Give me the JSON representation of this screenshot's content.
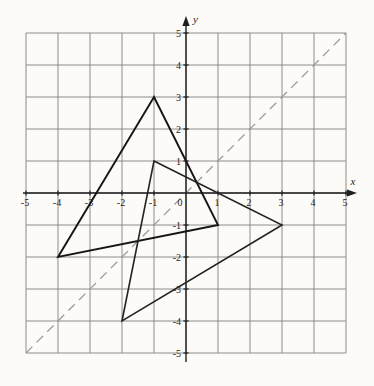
{
  "figure": {
    "width": 374,
    "height": 386,
    "background": "#fcfbf8"
  },
  "chart_data": {
    "type": "line",
    "title": "",
    "xlabel": "x",
    "ylabel": "y",
    "xlim": [
      -5,
      5
    ],
    "ylim": [
      -5,
      5
    ],
    "grid": true,
    "legend": "none",
    "unit_px": 32,
    "origin_px": [
      186,
      193
    ],
    "x_ticks": [
      -5,
      -4,
      -3,
      -2,
      -1,
      0,
      1,
      2,
      3,
      4,
      5
    ],
    "y_ticks": [
      -5,
      -4,
      -3,
      -2,
      -1,
      1,
      2,
      3,
      4,
      5
    ],
    "colors": {
      "grid": "#8c8c8c",
      "axis": "#1f1f1f",
      "labels": "#1e1e1e",
      "triangle": "#161616",
      "mirror_line": "#9a9a9a",
      "background": "#fcfbf8"
    },
    "series": [
      {
        "name": "triangle-preimage",
        "kind": "polygon",
        "points": [
          [
            -1,
            3
          ],
          [
            1,
            -1
          ],
          [
            -4,
            -2
          ]
        ],
        "stroke": "#161616",
        "stroke_width": 1.9,
        "dash": ""
      },
      {
        "name": "triangle-image",
        "kind": "polygon",
        "points": [
          [
            -1,
            1
          ],
          [
            3,
            -1
          ],
          [
            -2,
            -4
          ]
        ],
        "stroke": "#242424",
        "stroke_width": 1.6,
        "dash": ""
      },
      {
        "name": "mirror-line-y-equals-x",
        "kind": "line",
        "points": [
          [
            -5,
            -5
          ],
          [
            5,
            5
          ]
        ],
        "stroke": "#9a9a9a",
        "stroke_width": 1.3,
        "dash": "9 6"
      }
    ]
  }
}
